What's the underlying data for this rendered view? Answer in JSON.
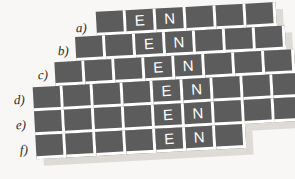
{
  "figure": {
    "background_color": "#f8f7f5",
    "cell_color": "#5c5c5c",
    "gridline_color": "#ffffff",
    "letter_color": "#ffffff",
    "shadow_color": "#dedbd6",
    "rotation_degrees": -3.1,
    "cell_width_px": 30,
    "cell_height_px": 24
  },
  "rows": [
    {
      "label": "a)",
      "label_left": 76,
      "label_top": 20,
      "row_left": 100,
      "row_top": 9,
      "cells": [
        "",
        "E",
        "N",
        "",
        "",
        ""
      ]
    },
    {
      "label": "b)",
      "label_left": 58,
      "label_top": 43,
      "row_left": 78,
      "row_top": 33,
      "cells": [
        "",
        "",
        "E",
        "N",
        "",
        "",
        ""
      ]
    },
    {
      "label": "c)",
      "label_left": 38,
      "label_top": 67,
      "row_left": 56,
      "row_top": 57,
      "cells": [
        "",
        "",
        "",
        "E",
        "N",
        "",
        "",
        ""
      ]
    },
    {
      "label": "d)",
      "label_left": 14,
      "label_top": 92,
      "row_left": 33,
      "row_top": 81,
      "cells": [
        "",
        "",
        "",
        "",
        "E",
        "N",
        "",
        "",
        ""
      ]
    },
    {
      "label": "e)",
      "label_left": 16,
      "label_top": 117,
      "row_left": 33,
      "row_top": 105,
      "cells": [
        "",
        "",
        "",
        "",
        "E",
        "N",
        "",
        "",
        ""
      ]
    },
    {
      "label": "f)",
      "label_left": 20,
      "label_top": 142,
      "row_left": 33,
      "row_top": 129,
      "cells": [
        "",
        "",
        "",
        "",
        "E",
        "N",
        ""
      ]
    }
  ],
  "chart_data": {
    "type": "table",
    "row_labels": [
      "a)",
      "b)",
      "c)",
      "d)",
      "e)",
      "f)"
    ],
    "row_cell_counts": [
      6,
      7,
      8,
      9,
      9,
      7
    ],
    "letters": [
      "E",
      "N"
    ],
    "letter_positions_zero_indexed": [
      {
        "row": "a)",
        "E": 1,
        "N": 2
      },
      {
        "row": "b)",
        "E": 2,
        "N": 3
      },
      {
        "row": "c)",
        "E": 3,
        "N": 4
      },
      {
        "row": "d)",
        "E": 4,
        "N": 5
      },
      {
        "row": "e)",
        "E": 4,
        "N": 5
      },
      {
        "row": "f)",
        "E": 4,
        "N": 5
      }
    ],
    "grid": [
      [
        "",
        "E",
        "N",
        "",
        "",
        ""
      ],
      [
        "",
        "",
        "E",
        "N",
        "",
        "",
        ""
      ],
      [
        "",
        "",
        "",
        "E",
        "N",
        "",
        "",
        ""
      ],
      [
        "",
        "",
        "",
        "",
        "E",
        "N",
        "",
        "",
        ""
      ],
      [
        "",
        "",
        "",
        "",
        "E",
        "N",
        "",
        "",
        ""
      ],
      [
        "",
        "",
        "",
        "",
        "E",
        "N",
        ""
      ]
    ]
  }
}
